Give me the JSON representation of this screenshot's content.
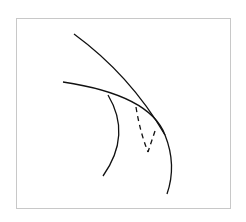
{
  "diagram": {
    "frame_color": "#c8c8c8",
    "stroke_color": "#111111",
    "curves": [
      {
        "name": "upper-curve",
        "style": "solid"
      },
      {
        "name": "middle-long-curve",
        "style": "solid"
      },
      {
        "name": "inner-arc",
        "style": "solid"
      },
      {
        "name": "dashed-lines",
        "style": "dashed"
      }
    ]
  }
}
